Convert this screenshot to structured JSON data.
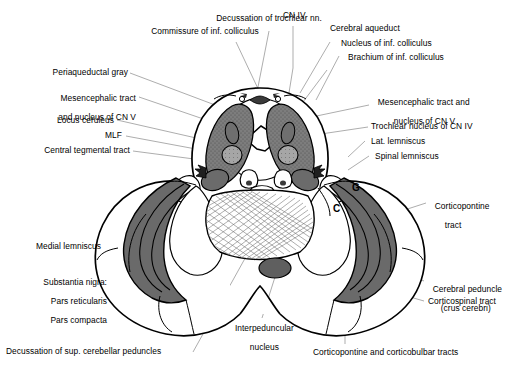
{
  "figure": {
    "type": "anatomical-cross-section",
    "colors": {
      "outline": "#000000",
      "background": "#ffffff",
      "dark_gray_structure": "#6e6e6e",
      "mid_gray_structure": "#8a8a8a",
      "light_gray_structure": "#b5b5b5",
      "leader_line": "#7a7a7a"
    }
  },
  "labels": {
    "top": [
      {
        "id": "decussation-trochlear",
        "text": "Decussation of trochlear nn."
      },
      {
        "id": "commissure-inf-colliculus",
        "text": "Commissure of inf. colliculus"
      },
      {
        "id": "cn-iv",
        "text": "CN IV"
      },
      {
        "id": "cerebral-aqueduct",
        "text": "Cerebral aqueduct"
      },
      {
        "id": "nucleus-inf-colliculus",
        "text": "Nucleus of inf. colliculus"
      },
      {
        "id": "brachium-inf-colliculus",
        "text": "Brachium of inf. colliculus"
      }
    ],
    "left": [
      {
        "id": "periaqueductal-gray",
        "text": "Periaqueductal gray"
      },
      {
        "id": "mesencephalic-tract-left",
        "line1": "Mesencephalic tract",
        "line2": "and nucleus of CN V"
      },
      {
        "id": "locus-ceruleus",
        "text": "Locus ceruleus"
      },
      {
        "id": "mlf",
        "text": "MLF"
      },
      {
        "id": "central-tegmental-tract",
        "text": "Central tegmental tract"
      },
      {
        "id": "medial-lemniscus",
        "text": "Medial lemniscus"
      },
      {
        "id": "substantia-nigra",
        "line1": "Substantia nigra:",
        "line2": "Pars reticularis",
        "line3": "Pars compacta"
      },
      {
        "id": "decussation-sup-cerebellar",
        "text": "Decussation of sup. cerebellar peduncles"
      }
    ],
    "right": [
      {
        "id": "mesencephalic-tract-right",
        "line1": "Mesencephalic tract and",
        "line2": "nucleus of CN V"
      },
      {
        "id": "trochlear-nucleus",
        "text": "Trochlear nucleus of CN IV"
      },
      {
        "id": "lat-lemniscus",
        "text": "Lat. lemniscus"
      },
      {
        "id": "spinal-lemniscus",
        "text": "Spinal lemniscus"
      },
      {
        "id": "corticopontine-tract",
        "line1": "Corticopontine",
        "line2": "tract"
      },
      {
        "id": "cerebral-peduncle",
        "line1": "Cerebral peduncle",
        "line2": "(crus cerebri)"
      },
      {
        "id": "corticospinal-tract",
        "text": "Corticospinal tract"
      }
    ],
    "bottom": [
      {
        "id": "interpeduncular-nucleus",
        "line1": "Interpeduncular",
        "line2": "nucleus"
      },
      {
        "id": "corticopontine-corticobulbar",
        "text": "Corticopontine and corticobulbar tracts"
      }
    ],
    "region_letters": [
      {
        "id": "letter-g",
        "text": "G"
      },
      {
        "id": "letter-c",
        "text": "C"
      }
    ]
  }
}
